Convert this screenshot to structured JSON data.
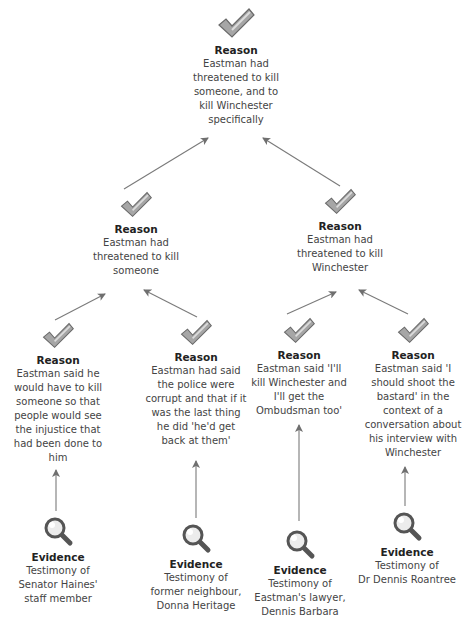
{
  "colors": {
    "arrow": "#6f6f6f",
    "check_fill": "#9a9a9a",
    "check_dark": "#6a6a6a",
    "lens_ring": "#555555",
    "lens_glass": "#e8e8e8"
  },
  "nodes": {
    "root": {
      "type": "Reason",
      "title": "Reason",
      "text": [
        "Eastman had",
        "threatened to kill",
        "someone, and to",
        "kill Winchester",
        "specifically"
      ]
    },
    "left_reason": {
      "type": "Reason",
      "title": "Reason",
      "text": [
        "Eastman had",
        "threatened to kill",
        "someone"
      ]
    },
    "right_reason": {
      "type": "Reason",
      "title": "Reason",
      "text": [
        "Eastman had",
        "threatened to kill",
        "Winchester"
      ]
    },
    "reason_1": {
      "type": "Reason",
      "title": "Reason",
      "text": [
        "Eastman said he",
        "would have to kill",
        "someone so that",
        "people would see",
        "the injustice that",
        "had been done to",
        "him"
      ]
    },
    "reason_2": {
      "type": "Reason",
      "title": "Reason",
      "text": [
        "Eastman had said",
        "the police were",
        "corrupt and that if it",
        "was the last thing",
        "he did 'he'd get",
        "back at them'"
      ]
    },
    "reason_3": {
      "type": "Reason",
      "title": "Reason",
      "text": [
        "Eastman said 'I'll",
        "kill Winchester and",
        "I'll get the",
        "Ombudsman too'"
      ]
    },
    "reason_4": {
      "type": "Reason",
      "title": "Reason",
      "text": [
        "Eastman said 'I",
        "should shoot the",
        "bastard' in the",
        "context of a",
        "conversation about",
        "his interview with",
        "Winchester"
      ]
    },
    "evidence_1": {
      "type": "Evidence",
      "title": "Evidence",
      "text": [
        "Testimony of",
        "Senator Haines'",
        "staff member"
      ]
    },
    "evidence_2": {
      "type": "Evidence",
      "title": "Evidence",
      "text": [
        "Testimony of",
        "former neighbour,",
        "Donna Heritage"
      ]
    },
    "evidence_3": {
      "type": "Evidence",
      "title": "Evidence",
      "text": [
        "Testimony of",
        "Eastman's lawyer,",
        "Dennis Barbara"
      ]
    },
    "evidence_4": {
      "type": "Evidence",
      "title": "Evidence",
      "text": [
        "Testimony of",
        "Dr Dennis Roantree"
      ]
    }
  },
  "edges": [
    {
      "from": "left_reason",
      "to": "root"
    },
    {
      "from": "right_reason",
      "to": "root"
    },
    {
      "from": "reason_1",
      "to": "left_reason"
    },
    {
      "from": "reason_2",
      "to": "left_reason"
    },
    {
      "from": "reason_3",
      "to": "right_reason"
    },
    {
      "from": "reason_4",
      "to": "right_reason"
    },
    {
      "from": "evidence_1",
      "to": "reason_1"
    },
    {
      "from": "evidence_2",
      "to": "reason_2"
    },
    {
      "from": "evidence_3",
      "to": "reason_3"
    },
    {
      "from": "evidence_4",
      "to": "reason_4"
    }
  ]
}
